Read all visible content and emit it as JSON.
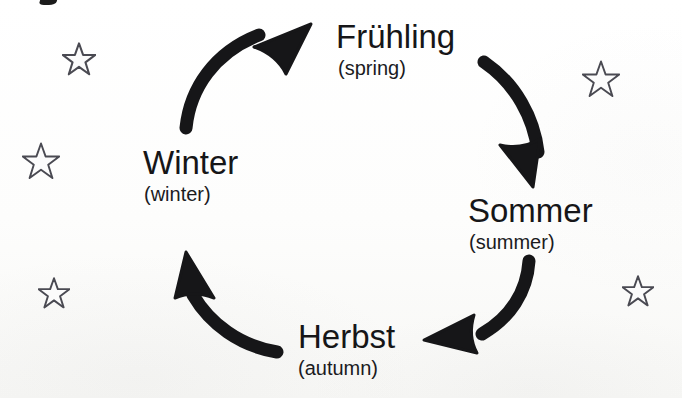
{
  "diagram": {
    "direction": "clockwise",
    "background_color": "#fdfdfc",
    "ink_color": "#161618",
    "star_stroke_color": "#4a4a52",
    "seasons": [
      {
        "id": "fruehling",
        "german": "Frühling",
        "english": "(spring)",
        "position": "top"
      },
      {
        "id": "sommer",
        "german": "Sommer",
        "english": "(summer)",
        "position": "right"
      },
      {
        "id": "herbst",
        "german": "Herbst",
        "english": "(autumn)",
        "position": "bottom"
      },
      {
        "id": "winter",
        "german": "Winter",
        "english": "(winter)",
        "position": "left"
      }
    ],
    "arrows": [
      {
        "id": "arrow-winter-to-fruehling",
        "from": "winter",
        "to": "fruehling",
        "points": "up-right"
      },
      {
        "id": "arrow-fruehling-to-sommer",
        "from": "fruehling",
        "to": "sommer",
        "points": "down"
      },
      {
        "id": "arrow-sommer-to-herbst",
        "from": "sommer",
        "to": "herbst",
        "points": "left"
      },
      {
        "id": "arrow-herbst-to-winter",
        "from": "herbst",
        "to": "winter",
        "points": "up"
      }
    ],
    "stars": [
      {
        "id": "star-top-left",
        "size": 34
      },
      {
        "id": "star-mid-left",
        "size": 38
      },
      {
        "id": "star-bottom-left",
        "size": 32
      },
      {
        "id": "star-top-right",
        "size": 38
      },
      {
        "id": "star-bottom-right",
        "size": 32
      }
    ]
  }
}
